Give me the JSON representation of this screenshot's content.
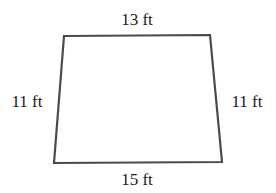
{
  "diagram": {
    "shape": "trapezoid",
    "vertices": {
      "top_left": [
        64,
        36
      ],
      "top_right": [
        210,
        35
      ],
      "bottom_right": [
        222,
        162
      ],
      "bottom_left": [
        54,
        163
      ]
    },
    "stroke_color": "#4a4a4a",
    "labels": {
      "top": "13 ft",
      "bottom": "15 ft",
      "left": "11 ft",
      "right": "11 ft"
    }
  }
}
